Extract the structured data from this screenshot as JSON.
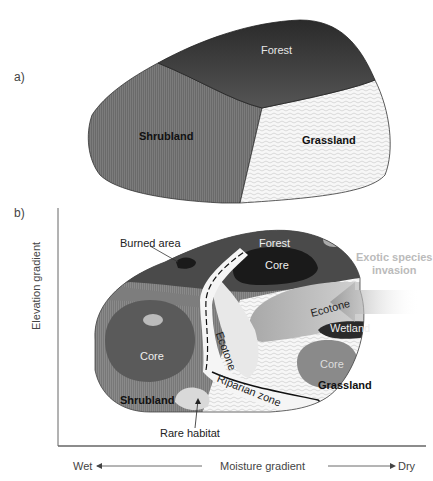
{
  "panel_a": {
    "label": "a)",
    "regions": [
      {
        "name": "Forest",
        "fill": "#3a3a3a"
      },
      {
        "name": "Shrubland",
        "fill": "#6e6e6e"
      },
      {
        "name": "Grassland",
        "fill": "#f2f2f2"
      }
    ]
  },
  "panel_b": {
    "label": "b)",
    "regions": {
      "forest": "Forest",
      "forest_core": "Core",
      "shrubland": "Shrubland",
      "shrubland_core": "Core",
      "grassland": "Grassland",
      "grassland_core": "Core",
      "ecotone_vertical": "Ecotone",
      "ecotone_horizontal": "Ecotone",
      "wetland": "Wetland",
      "riparian": "Riparian zone"
    },
    "annotations": {
      "burned_area": "Burned area",
      "rare_habitat": "Rare habitat",
      "exotic_line1": "Exotic species",
      "exotic_line2": "invasion"
    },
    "axes": {
      "y_label": "Elevation gradient",
      "x_label": "Moisture gradient",
      "x_left": "Wet",
      "x_right": "Dry"
    }
  }
}
